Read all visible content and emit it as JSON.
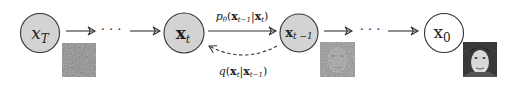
{
  "diagram": {
    "colors": {
      "node_fill_shaded": "#d3d3d3",
      "node_fill_plain": "#ffffff",
      "stroke": "#333333",
      "text": "#222222"
    },
    "nodes": [
      {
        "id": "xT",
        "label_main": "x",
        "label_sub": "T",
        "shaded": true,
        "image": "pure-noise"
      },
      {
        "id": "xt",
        "label_main": "x",
        "label_sub": "t",
        "shaded": true,
        "image": ""
      },
      {
        "id": "xt-1",
        "label_main": "x",
        "label_sub": "t −1",
        "shaded": true,
        "image": "partially-denoised-face"
      },
      {
        "id": "x0",
        "label_main": "x",
        "label_sub": "0",
        "shaded": false,
        "image": "clean-face"
      }
    ],
    "ellipsis": "· · ·",
    "edges": {
      "reverse": {
        "label_p": "p",
        "label_theta": "θ",
        "label_open": "(",
        "label_x1": "x",
        "label_x1_sub": "t−1",
        "label_bar": "|",
        "label_x2": "x",
        "label_x2_sub": "t",
        "label_close": ")"
      },
      "forward": {
        "label_q": "q",
        "label_open": "(",
        "label_x1": "x",
        "label_x1_sub": "t",
        "label_bar": "|",
        "label_x2": "x",
        "label_x2_sub": "t−1",
        "label_close": ")"
      }
    }
  }
}
